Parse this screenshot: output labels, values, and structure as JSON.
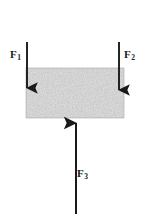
{
  "figure": {
    "width": 147,
    "height": 216,
    "background_color": "#ffffff",
    "ink_color": "#1a1a1a"
  },
  "block": {
    "name": "shaded-block",
    "fill_description": "gray speckled / stippled texture",
    "fill_color": "#b3b3b3",
    "speckle_light": "#d8d8d8",
    "speckle_dark": "#8f8f8f",
    "x": 26,
    "y": 68,
    "width": 98,
    "height": 50
  },
  "forces": [
    {
      "id": "f1",
      "symbol": "F",
      "subscript": "1",
      "label": "F1",
      "direction": "down",
      "arrow_x": 27,
      "arrow_start_y": 42,
      "arrow_end_y": 93,
      "label_x": 10,
      "label_y": 49
    },
    {
      "id": "f2",
      "symbol": "F",
      "subscript": "2",
      "label": "F2",
      "direction": "down",
      "arrow_x": 119,
      "arrow_start_y": 42,
      "arrow_end_y": 95,
      "label_x": 124,
      "label_y": 49
    },
    {
      "id": "f3",
      "symbol": "F",
      "subscript": "3",
      "label": "F3",
      "direction": "up",
      "arrow_x": 76,
      "arrow_start_y": 214,
      "arrow_end_y": 117,
      "label_x": 77,
      "label_y": 168
    }
  ]
}
